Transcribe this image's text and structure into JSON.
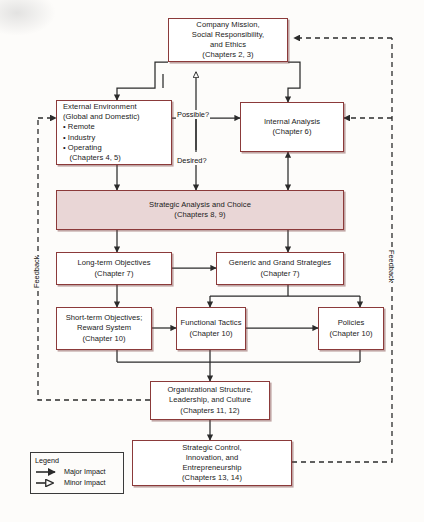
{
  "diagram": {
    "colors": {
      "box_border": "#8b3a3a",
      "box_fill": "#ffffff",
      "highlight_fill": "#e9d6d6",
      "line": "#2b2b2b",
      "background": "#fdfcfa"
    },
    "nodes": [
      {
        "id": "mission",
        "lines": [
          "Company Mission,",
          "Social Responsibility,",
          "and Ethics",
          "(Chapters 2, 3)"
        ],
        "shaded": false
      },
      {
        "id": "external",
        "lines": [
          "External Environment",
          "(Global and Domestic)",
          "• Remote",
          "• Industry",
          "• Operating",
          "   (Chapters 4, 5)"
        ],
        "shaded": false
      },
      {
        "id": "internal",
        "lines": [
          "Internal Analysis",
          "(Chapter 6)"
        ],
        "shaded": false
      },
      {
        "id": "strategic",
        "lines": [
          "Strategic Analysis and Choice",
          "(Chapters 8, 9)"
        ],
        "shaded": true
      },
      {
        "id": "longterm",
        "lines": [
          "Long-term Objectives",
          "(Chapter 7)"
        ],
        "shaded": false
      },
      {
        "id": "generic",
        "lines": [
          "Generic and Grand Strategies",
          "(Chapter 7)"
        ],
        "shaded": false
      },
      {
        "id": "shortterm",
        "lines": [
          "Short-term Objectives;",
          "Reward System",
          "(Chapter 10)"
        ],
        "shaded": false
      },
      {
        "id": "tactics",
        "lines": [
          "Functional Tactics",
          "(Chapter 10)"
        ],
        "shaded": false
      },
      {
        "id": "policies",
        "lines": [
          "Policies",
          "(Chapter 10)"
        ],
        "shaded": false
      },
      {
        "id": "orgstruct",
        "lines": [
          "Organizational Structure,",
          "Leadership, and Culture",
          "(Chapters 11, 12)"
        ],
        "shaded": false
      },
      {
        "id": "control",
        "lines": [
          "Strategic Control,",
          "Innovation, and",
          "Entrepreneurship",
          "(Chapters 13, 14)"
        ],
        "shaded": false
      }
    ],
    "edge_labels": {
      "possible": "Possible?",
      "desired": "Desired?"
    },
    "feedback_left": "Feedback",
    "feedback_right": "Feedback",
    "legend": {
      "title": "Legend",
      "major": "Major Impact",
      "minor": "Minor Impact"
    }
  }
}
